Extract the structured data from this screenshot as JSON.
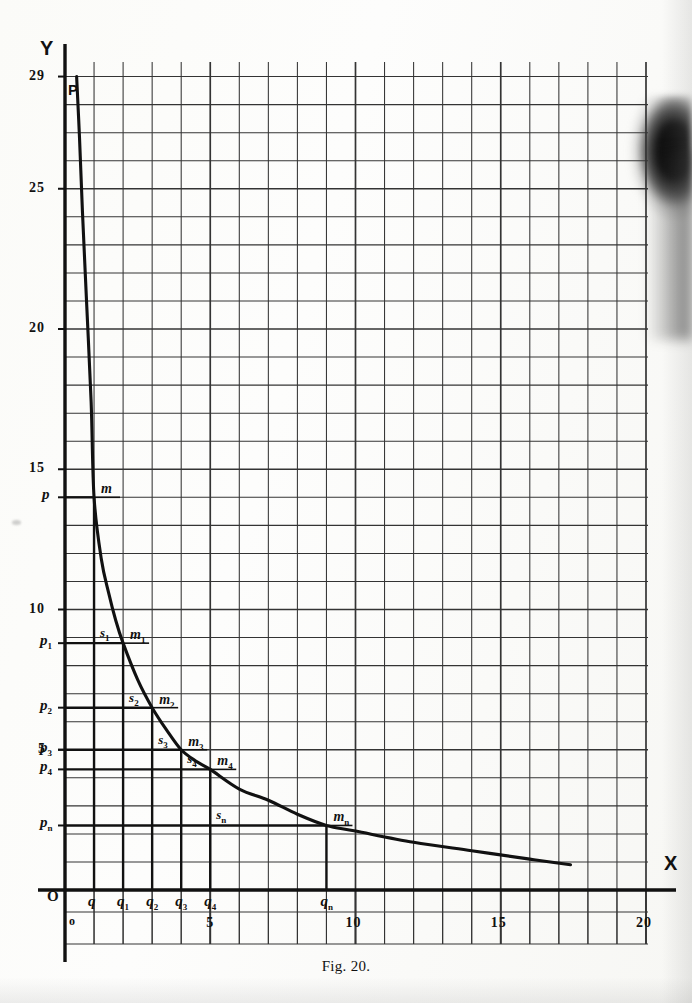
{
  "figure": {
    "caption": "Fig. 20.",
    "axis_labels": {
      "y": "Y",
      "x": "X"
    },
    "origin_label": "O",
    "scale_origin_label": "o",
    "curve_start_point_label": "P"
  },
  "colors": {
    "ink": "#111111",
    "grid": "#2b2b2b",
    "paper": "#fdfdfb"
  },
  "axes": {
    "y_numeric_ticks": [
      {
        "label": "29",
        "value": 29
      },
      {
        "label": "25",
        "value": 25
      },
      {
        "label": "20",
        "value": 20
      },
      {
        "label": "15",
        "value": 15
      },
      {
        "label": "10",
        "value": 10
      },
      {
        "label": "5",
        "value": 5
      }
    ],
    "y_symbolic_ticks": [
      {
        "label": "p",
        "sub": "",
        "value": 14.0
      },
      {
        "label": "p",
        "sub": "1",
        "value": 8.8
      },
      {
        "label": "p",
        "sub": "2",
        "value": 6.5
      },
      {
        "label": "p",
        "sub": "3",
        "value": 5.0
      },
      {
        "label": "p",
        "sub": "4",
        "value": 4.3
      },
      {
        "label": "p",
        "sub": "n",
        "value": 2.3
      }
    ],
    "x_symbolic_ticks": [
      {
        "label": "q",
        "sub": "",
        "value": 1
      },
      {
        "label": "q",
        "sub": "1",
        "value": 2
      },
      {
        "label": "q",
        "sub": "2",
        "value": 3
      },
      {
        "label": "q",
        "sub": "3",
        "value": 4
      },
      {
        "label": "q",
        "sub": "4",
        "value": 5
      },
      {
        "label": "q",
        "sub": "n",
        "value": 9
      }
    ],
    "x_numeric_scale": [
      {
        "label": "0",
        "value": 0
      },
      {
        "label": "5",
        "value": 5
      },
      {
        "label": "10",
        "value": 10
      },
      {
        "label": "15",
        "value": 15
      },
      {
        "label": "20",
        "value": 20
      }
    ]
  },
  "curve_points": [
    {
      "label": "m",
      "sub": "",
      "x": 1,
      "y": 14.0
    },
    {
      "label": "m",
      "sub": "1",
      "x": 2,
      "y": 8.8
    },
    {
      "label": "m",
      "sub": "2",
      "x": 3,
      "y": 6.5
    },
    {
      "label": "m",
      "sub": "3",
      "x": 4,
      "y": 5.0
    },
    {
      "label": "m",
      "sub": "4",
      "x": 5,
      "y": 4.3
    },
    {
      "label": "m",
      "sub": "n",
      "x": 9,
      "y": 2.3
    }
  ],
  "step_corners": [
    {
      "label": "s",
      "sub": "1",
      "x": 1,
      "y": 8.8
    },
    {
      "label": "s",
      "sub": "2",
      "x": 2,
      "y": 6.5
    },
    {
      "label": "s",
      "sub": "3",
      "x": 3,
      "y": 5.0
    },
    {
      "label": "s",
      "sub": "4",
      "x": 4,
      "y": 4.3
    },
    {
      "label": "s",
      "sub": "n",
      "x": 5,
      "y": 2.3
    }
  ],
  "chart_data": {
    "type": "line",
    "title": "Fig. 20.",
    "xlabel": "X",
    "ylabel": "Y",
    "xlim": [
      0,
      20
    ],
    "ylim": [
      0,
      30
    ],
    "grid": true,
    "legend": null,
    "series": [
      {
        "name": "curve",
        "x": [
          0.4,
          0.5,
          0.6,
          0.75,
          0.9,
          1.0,
          1.25,
          1.5,
          1.75,
          2.0,
          2.5,
          3.0,
          3.5,
          4.0,
          4.5,
          5.0,
          6.0,
          7.0,
          8.0,
          9.0,
          10.0,
          12.0,
          14.0,
          16.0,
          17.4
        ],
        "y": [
          29.0,
          26.8,
          24.2,
          20.8,
          17.4,
          14.0,
          11.8,
          10.6,
          9.6,
          8.8,
          7.5,
          6.5,
          5.7,
          5.0,
          4.6,
          4.3,
          3.6,
          3.2,
          2.7,
          2.3,
          2.1,
          1.7,
          1.4,
          1.1,
          0.9
        ]
      }
    ],
    "annotations": [
      {
        "text": "P",
        "x": 0.4,
        "y": 29.0
      },
      {
        "text": "m",
        "x": 1.0,
        "y": 14.0
      },
      {
        "text": "m1",
        "x": 2.0,
        "y": 8.8
      },
      {
        "text": "m2",
        "x": 3.0,
        "y": 6.5
      },
      {
        "text": "m3",
        "x": 4.0,
        "y": 5.0
      },
      {
        "text": "m4",
        "x": 5.0,
        "y": 4.3
      },
      {
        "text": "mn",
        "x": 9.0,
        "y": 2.3
      },
      {
        "text": "s1",
        "x": 1.0,
        "y": 8.8
      },
      {
        "text": "s2",
        "x": 2.0,
        "y": 6.5
      },
      {
        "text": "s3",
        "x": 3.0,
        "y": 5.0
      },
      {
        "text": "s4",
        "x": 4.0,
        "y": 4.3
      },
      {
        "text": "sn",
        "x": 5.0,
        "y": 2.3
      }
    ]
  }
}
